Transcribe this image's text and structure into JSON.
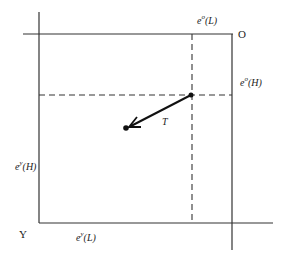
{
  "diagram": {
    "type": "edgeworth-box",
    "origins": {
      "top_right": "O",
      "bottom_left": "Y"
    },
    "labels": {
      "top_axis": {
        "base": "e",
        "sup": "o",
        "arg": "(L)"
      },
      "right_axis": {
        "base": "e",
        "sup": "o",
        "arg": "(H)"
      },
      "left_axis": {
        "base": "e",
        "sup": "y",
        "arg": "(H)"
      },
      "bottom_axis": {
        "base": "e",
        "sup": "y",
        "arg": "(L)"
      },
      "trade_vector": "T"
    },
    "colors": {
      "line": "#333333",
      "background": "#ffffff"
    }
  }
}
